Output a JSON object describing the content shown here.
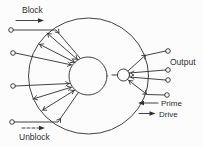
{
  "labels": {
    "block": "Block",
    "unblock": "Unblock",
    "output": "Output",
    "prime": "Prime",
    "drive": "Drive"
  },
  "colors": {
    "ink": "#2e2e2e",
    "background": "#fcfcfc"
  },
  "terminals": {
    "left_count": 4,
    "right_count": 4
  }
}
